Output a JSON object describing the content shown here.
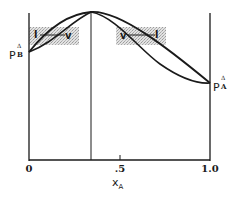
{
  "figure": {
    "x_axis": {
      "label_main": "x",
      "label_sub": "A",
      "ticks": [
        "0",
        ".5",
        "1.0"
      ]
    },
    "left_point": {
      "main": "P",
      "sup": "Δ",
      "sub": "B"
    },
    "right_point": {
      "main": "P",
      "sup": "Δ",
      "sub": "A"
    },
    "left_region": {
      "left_label": "l",
      "right_label": "v"
    },
    "right_region": {
      "left_label": "v",
      "right_label": "l"
    },
    "colors": {
      "line": "#1a1a1a",
      "shade": "#d6d6d6",
      "background": "#ffffff"
    }
  }
}
